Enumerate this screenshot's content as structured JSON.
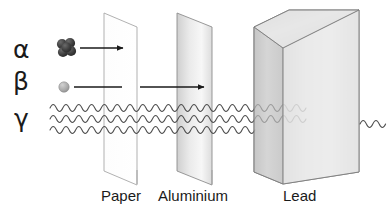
{
  "diagram": {
    "background_color": "#ffffff",
    "line_color": "#1a1a1a",
    "radiation_rows": [
      {
        "symbol": "α",
        "name": "alpha",
        "particle_icon": "alpha-particle-cluster-icon",
        "particle_color": "#3b3b3b",
        "path_style": "arrow",
        "stopped_by": "Paper"
      },
      {
        "symbol": "β",
        "name": "beta",
        "particle_icon": "beta-particle-dot-icon",
        "particle_color": "#9a9a9a",
        "path_style": "arrow",
        "stopped_by": "Aluminium"
      },
      {
        "symbol": "γ",
        "name": "gamma",
        "particle_icon": "gamma-wave-icon",
        "particle_color": "#555555",
        "path_style": "waves",
        "stopped_by": "Lead"
      }
    ],
    "barriers": [
      {
        "label": "Paper",
        "shape": "thin-sheet",
        "fill_color": "#fdfdfd",
        "edge_color": "#9c9c9c"
      },
      {
        "label": "Aluminium",
        "shape": "thin-sheet",
        "fill_color": "#e3e3e3",
        "edge_color": "#8d8d8d"
      },
      {
        "label": "Lead",
        "shape": "solid-block",
        "fill_color": "#d8d8d8",
        "edge_color": "#777777"
      }
    ],
    "gamma_wave_counts": {
      "before_paper": 3,
      "after_paper": 3,
      "after_aluminium": 3,
      "after_lead": 1
    }
  }
}
